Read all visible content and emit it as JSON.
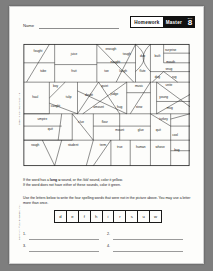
{
  "header": {
    "name_label": "Name",
    "homework_label": "Homework",
    "master_label": "Master",
    "badge_sub": "BLM",
    "badge_number": "8"
  },
  "margin": {
    "unit_text": "Spelling Connections Unit 8",
    "copyright_text": "Copyright © Zaner-Bloser, Inc."
  },
  "instructions": {
    "line1": "If the word has a long u sound, or the /ōō/ sound, color it yellow.",
    "line1_bold": "long u",
    "line2": "If the word does not have either of these sounds, color it green.",
    "line3": "Use the letters below to write the four spelling words that were not in the",
    "line4": "picture above. You may use a letter more than once."
  },
  "letter_bank": [
    "d",
    "e",
    "f",
    "h",
    "i",
    "r",
    "s",
    "u",
    "w"
  ],
  "answers": [
    {
      "number": "1."
    },
    {
      "number": "2."
    },
    {
      "number": "3."
    },
    {
      "number": "4."
    }
  ],
  "maze": {
    "words": [
      {
        "text": "fought",
        "x": 17,
        "y": 10
      },
      {
        "text": "juice",
        "x": 58,
        "y": 13
      },
      {
        "text": "enough",
        "x": 100,
        "y": 7
      },
      {
        "text": "tough",
        "x": 118,
        "y": 13
      },
      {
        "text": "due",
        "x": 136,
        "y": 15
      },
      {
        "text": "built",
        "x": 153,
        "y": 15
      },
      {
        "text": "surprise",
        "x": 168,
        "y": 9
      },
      {
        "text": "mouth",
        "x": 168,
        "y": 22
      },
      {
        "text": "naught",
        "x": 105,
        "y": 22
      },
      {
        "text": "tube",
        "x": 23,
        "y": 33
      },
      {
        "text": "fruit",
        "x": 58,
        "y": 33
      },
      {
        "text": "toe",
        "x": 95,
        "y": 33
      },
      {
        "text": "laugh",
        "x": 114,
        "y": 33
      },
      {
        "text": "flute",
        "x": 136,
        "y": 33
      },
      {
        "text": "snug",
        "x": 166,
        "y": 30
      },
      {
        "text": "dug",
        "x": 153,
        "y": 39
      },
      {
        "text": "rug",
        "x": 172,
        "y": 39
      },
      {
        "text": "boy",
        "x": 37,
        "y": 50
      },
      {
        "text": "quiet",
        "x": 93,
        "y": 49
      },
      {
        "text": "music",
        "x": 132,
        "y": 49
      },
      {
        "text": "unite",
        "x": 166,
        "y": 48
      },
      {
        "text": "haul",
        "x": 14,
        "y": 62
      },
      {
        "text": "tulip",
        "x": 52,
        "y": 62
      },
      {
        "text": "doubt",
        "x": 75,
        "y": 60
      },
      {
        "text": "judge",
        "x": 104,
        "y": 59
      },
      {
        "text": "young",
        "x": 160,
        "y": 62
      },
      {
        "text": "caught",
        "x": 37,
        "y": 72
      },
      {
        "text": "amount",
        "x": 86,
        "y": 73
      },
      {
        "text": "hug",
        "x": 110,
        "y": 73
      },
      {
        "text": "stew",
        "x": 132,
        "y": 73
      },
      {
        "text": "mug",
        "x": 167,
        "y": 74
      },
      {
        "text": "umpire",
        "x": 22,
        "y": 87
      },
      {
        "text": "clue",
        "x": 66,
        "y": 90
      },
      {
        "text": "flour",
        "x": 93,
        "y": 90
      },
      {
        "text": "turkey",
        "x": 160,
        "y": 87
      },
      {
        "text": "quit",
        "x": 31,
        "y": 98
      },
      {
        "text": "mount",
        "x": 110,
        "y": 100
      },
      {
        "text": "glue",
        "x": 134,
        "y": 100
      },
      {
        "text": "quit",
        "x": 154,
        "y": 100
      },
      {
        "text": "cool",
        "x": 173,
        "y": 105
      },
      {
        "text": "rough",
        "x": 14,
        "y": 117
      },
      {
        "text": "student",
        "x": 57,
        "y": 117
      },
      {
        "text": "term",
        "x": 91,
        "y": 117
      },
      {
        "text": "true",
        "x": 110,
        "y": 119
      },
      {
        "text": "human",
        "x": 134,
        "y": 119
      },
      {
        "text": "whose",
        "x": 156,
        "y": 119
      },
      {
        "text": "bug",
        "x": 175,
        "y": 122
      }
    ]
  }
}
